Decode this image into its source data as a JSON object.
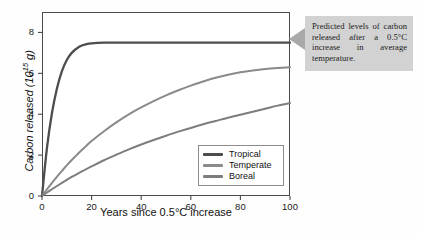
{
  "chart_data": {
    "type": "line",
    "title": "",
    "xlabel": "Years since 0.5°C increase",
    "ylabel": "Carbon released (10¹⁵ g)",
    "ylabel_parts": {
      "main": "Carbon released (10",
      "sup": "15",
      "tail": " g)"
    },
    "xlim": [
      0,
      100
    ],
    "ylim": [
      0,
      9
    ],
    "grid": false,
    "xticks": [
      0,
      20,
      40,
      60,
      80,
      100
    ],
    "yticks": [
      0,
      2,
      4,
      6,
      8
    ],
    "legend_position": "inside-bottom-right",
    "x": [
      0,
      2,
      4,
      6,
      8,
      10,
      12,
      15,
      18,
      20,
      25,
      30,
      35,
      40,
      45,
      50,
      55,
      60,
      65,
      70,
      75,
      80,
      85,
      90,
      95,
      100
    ],
    "series": [
      {
        "name": "Tropical",
        "color": "#4d4d4d",
        "values": [
          0.0,
          2.35,
          4.05,
          5.25,
          6.1,
          6.65,
          7.0,
          7.3,
          7.43,
          7.47,
          7.5,
          7.5,
          7.5,
          7.5,
          7.5,
          7.5,
          7.5,
          7.5,
          7.5,
          7.5,
          7.5,
          7.5,
          7.5,
          7.5,
          7.5,
          7.5
        ]
      },
      {
        "name": "Temperate",
        "color": "#8a8a8a",
        "values": [
          0.0,
          0.33,
          0.64,
          0.94,
          1.22,
          1.5,
          1.76,
          2.13,
          2.47,
          2.69,
          3.17,
          3.6,
          3.99,
          4.33,
          4.64,
          4.92,
          5.17,
          5.4,
          5.6,
          5.78,
          5.93,
          6.05,
          6.14,
          6.21,
          6.26,
          6.3
        ]
      },
      {
        "name": "Boreal",
        "color": "#7d7d7d",
        "values": [
          0.0,
          0.17,
          0.33,
          0.49,
          0.64,
          0.79,
          0.93,
          1.13,
          1.33,
          1.45,
          1.75,
          2.02,
          2.28,
          2.52,
          2.74,
          2.95,
          3.15,
          3.33,
          3.51,
          3.67,
          3.83,
          3.97,
          4.12,
          4.27,
          4.42,
          4.55
        ]
      }
    ]
  },
  "legend": {
    "items": [
      {
        "label": "Tropical"
      },
      {
        "label": "Temperate"
      },
      {
        "label": "Boreal"
      }
    ]
  },
  "callout": {
    "text": "Predicted levels of carbon released after a 0.5°C increase in average temperature."
  }
}
